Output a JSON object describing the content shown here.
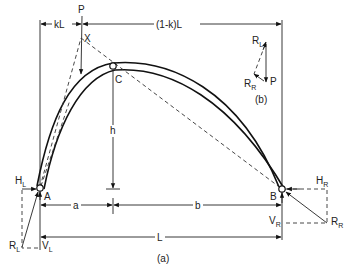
{
  "figure": {
    "caption_a": "(a)",
    "caption_b": "(b)"
  },
  "labels": {
    "P": "P",
    "X": "X",
    "C": "C",
    "A": "A",
    "B": "B",
    "h": "h",
    "a": "a",
    "b": "b",
    "L": "L",
    "kL": "kL",
    "one_minus_k_L": "(1-k)L",
    "H_L": "H",
    "H_L_sub": "L",
    "V_L": "V",
    "V_L_sub": "L",
    "R_L": "R",
    "R_L_sub": "L",
    "H_R": "H",
    "H_R_sub": "R",
    "V_R": "V",
    "V_R_sub": "R",
    "R_R": "R",
    "R_R_sub": "R"
  },
  "force_polygon": {
    "R_L": "R",
    "R_L_sub": "L",
    "R_R": "R",
    "R_R_sub": "R",
    "P": "P"
  },
  "colors": {
    "line": "#222222",
    "background": "#ffffff"
  }
}
